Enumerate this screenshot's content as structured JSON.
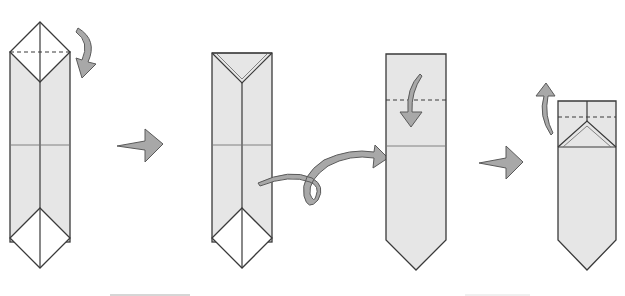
{
  "diagram": {
    "colors": {
      "paper": "#e6e6e6",
      "outline": "#3a3a3a",
      "arrow": "#a8a8a8",
      "background": "#ffffff"
    },
    "steps": [
      {
        "id": 1,
        "label": "Step 1",
        "action": "valley fold top triangle down",
        "arrow": "curved-down-arrow"
      },
      {
        "id": 2,
        "label": "Step 2",
        "action": "turn over",
        "arrow": "loop-turn-over-arrow"
      },
      {
        "id": 3,
        "label": "Step 3",
        "action": "valley fold top edge down along dashed line",
        "arrow": "curved-down-arrow"
      },
      {
        "id": 4,
        "label": "Step 4",
        "action": "fold flap back up",
        "arrow": "curved-up-arrow"
      }
    ],
    "transitions": [
      {
        "from": 1,
        "to": 2,
        "icon": "next-step-arrow"
      },
      {
        "from": 3,
        "to": 4,
        "icon": "next-step-arrow"
      }
    ]
  }
}
